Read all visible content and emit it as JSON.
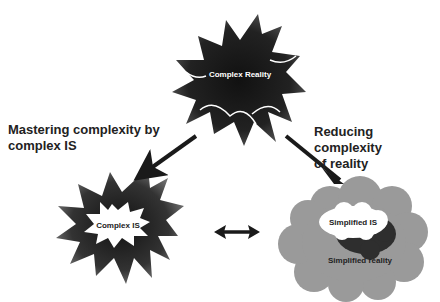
{
  "nodes": {
    "complex_reality": {
      "label": "Complex Reality"
    },
    "complex_is": {
      "label": "Complex IS"
    },
    "simplified_is": {
      "label": "Simplified IS"
    },
    "simplified_reality": {
      "label": "Simplified reality"
    }
  },
  "edges": {
    "left": {
      "label_line1": "Mastering complexity by",
      "label_line2": "complex IS"
    },
    "right": {
      "label_line1": "Reducing complexity",
      "label_line2": "of reality"
    }
  },
  "colors": {
    "splat_dark": "#1a1a1a",
    "cloud_gray": "#9a9a9a",
    "cloud_dark": "#2e2e2e",
    "arrow": "#1a1a1a"
  }
}
